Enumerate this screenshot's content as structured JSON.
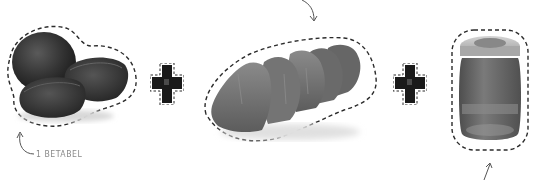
{
  "scene": {
    "type": "recipe-ingredients-illustration",
    "palette": {
      "background": "#ffffff",
      "dash_outline": "#2b2b2b",
      "label_text": "#8a8a8a",
      "arrow": "#555555",
      "beet_dark": "#2e2e2e",
      "beet_mid": "#444444",
      "meat": "#707070",
      "meat_dark": "#555555",
      "jar_lid": "#b9b9b9",
      "jar_body": "#6e6e6e",
      "plus_fill": "#1a1a1a"
    }
  },
  "ingredients": [
    {
      "id": "beets",
      "icon": "beetroot-icon",
      "label": "1 BETABEL"
    },
    {
      "id": "meat",
      "icon": "meat-chunks-icon",
      "label": ""
    },
    {
      "id": "jar",
      "icon": "jar-icon",
      "label": ""
    }
  ],
  "operators": [
    {
      "symbol": "+",
      "icon": "plus-icon"
    },
    {
      "symbol": "+",
      "icon": "plus-icon"
    }
  ],
  "annotations": {
    "beet_label": "1 BETABEL",
    "arrows": [
      "curved-arrow-up-left",
      "curved-arrow-down",
      "arrow-up"
    ]
  }
}
